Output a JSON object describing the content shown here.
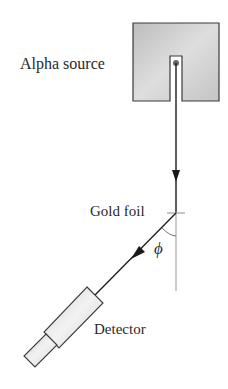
{
  "diagram": {
    "labels": {
      "source": "Alpha source",
      "foil": "Gold foil",
      "angle": "ϕ",
      "detector": "Detector"
    },
    "components": [
      {
        "id": "alpha-source",
        "shape": "box with slot",
        "fill": "#c8c8c8"
      },
      {
        "id": "gold-foil",
        "shape": "tick mark"
      },
      {
        "id": "detector",
        "shape": "cylinder",
        "fill": "#dcdcdc"
      }
    ],
    "beams": [
      {
        "from": "alpha-source",
        "to": "gold-foil",
        "direction": "down"
      },
      {
        "from": "gold-foil",
        "to": "detector",
        "direction": "down-left"
      }
    ],
    "angle": {
      "symbol": "ϕ",
      "between": [
        "incident beam axis",
        "scattered beam"
      ]
    },
    "colors": {
      "line": "#1a1a1a",
      "reference_line": "#a8a8a8",
      "source_fill": "#cfcfcf",
      "detector_fill": "#e2e2e2",
      "outline": "#3a3a3a"
    }
  }
}
